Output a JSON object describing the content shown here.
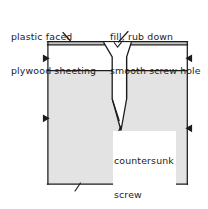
{
  "diagram": {
    "type": "architectural-section-detail",
    "colors": {
      "ink": "#1c1c1c",
      "framing_fill": "#e3e3e3",
      "sheeting_fill": "#ffffff",
      "plastic_face_fill": "#c9c9c9",
      "background": "#ffffff"
    },
    "labels": {
      "sheeting": {
        "line1": "plastic faced",
        "line2": "plywood sheeting"
      },
      "fill": {
        "line1": "fill, rub down",
        "line2": "smooth screw hole"
      },
      "screw": {
        "line1": "countersunk",
        "line2": "screw"
      },
      "framing": {
        "line1": "framing"
      }
    },
    "parts": [
      {
        "name": "plastic-face-layer",
        "label": "plastic faced"
      },
      {
        "name": "plywood-sheeting-layer",
        "label": "plywood sheeting"
      },
      {
        "name": "framing-member",
        "label": "framing"
      },
      {
        "name": "countersunk-screw",
        "label": "countersunk screw"
      },
      {
        "name": "filled-screw-hole",
        "label": "fill, rub down smooth screw hole"
      }
    ]
  }
}
